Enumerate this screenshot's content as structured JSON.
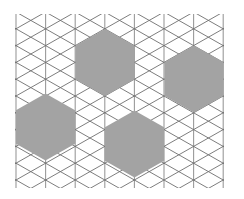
{
  "diagram": {
    "title": "",
    "type": "triangular-lattice-with-hexagons",
    "background": "#ffffff",
    "line_color": "#6e6e6e",
    "vertical_line_color": "#9a9a9a",
    "hexagon_fill": "#a3a3a3",
    "lattice": {
      "origin_x": 16,
      "origin_y": 12,
      "column_spacing": 29.6,
      "row_spacing": 33.6,
      "columns": 8,
      "clip": {
        "x": 15,
        "y": 14,
        "width": 209,
        "height": 174
      }
    },
    "hexagons": [
      {
        "name": "hexagon-top",
        "cx": 105,
        "cy": 62.5
      },
      {
        "name": "hexagon-right",
        "cx": 194,
        "cy": 79
      },
      {
        "name": "hexagon-left",
        "cx": 45.5,
        "cy": 127
      },
      {
        "name": "hexagon-bottom",
        "cx": 134.5,
        "cy": 144
      }
    ],
    "hexagon_radius": 33.6
  }
}
